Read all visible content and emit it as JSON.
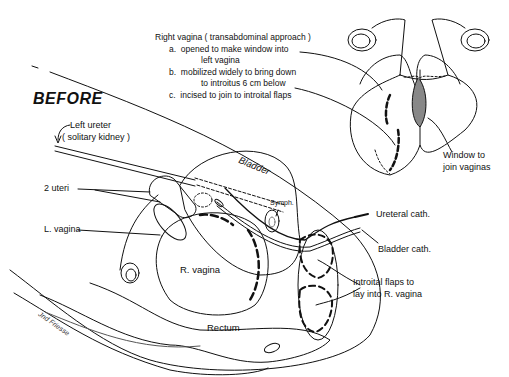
{
  "diagram": {
    "title": "BEFORE",
    "notes": {
      "heading": "Right vagina  ( transabdominal approach )",
      "items": [
        {
          "marker": "a.",
          "line1": "opened to make window into",
          "line2": "left vagina"
        },
        {
          "marker": "b.",
          "line1": "mobilized widely to bring down",
          "line2": "to introitus 6 cm below"
        },
        {
          "marker": "c.",
          "line1": "incised to join to introital flaps",
          "line2": ""
        }
      ]
    },
    "labels": {
      "left_ureter_1": "Left ureter",
      "left_ureter_2": "( solitary kidney )",
      "two_uteri": "2 uteri",
      "l_vagina": "L. vagina",
      "r_vagina": "R. vagina",
      "bladder": "Bladder",
      "symph": "Symph.",
      "rectum": "Rectum",
      "ureteral_cath": "Ureteral cath.",
      "bladder_cath": "Bladder cath.",
      "introital_flaps_1": "Introital flaps to",
      "introital_flaps_2": "lay into R. vagina",
      "window_1": "Window to",
      "window_2": "join vaginas"
    },
    "signature": "Jnd Friesse",
    "colors": {
      "ink": "#111111",
      "background": "#ffffff",
      "stipple": "#999999"
    }
  }
}
